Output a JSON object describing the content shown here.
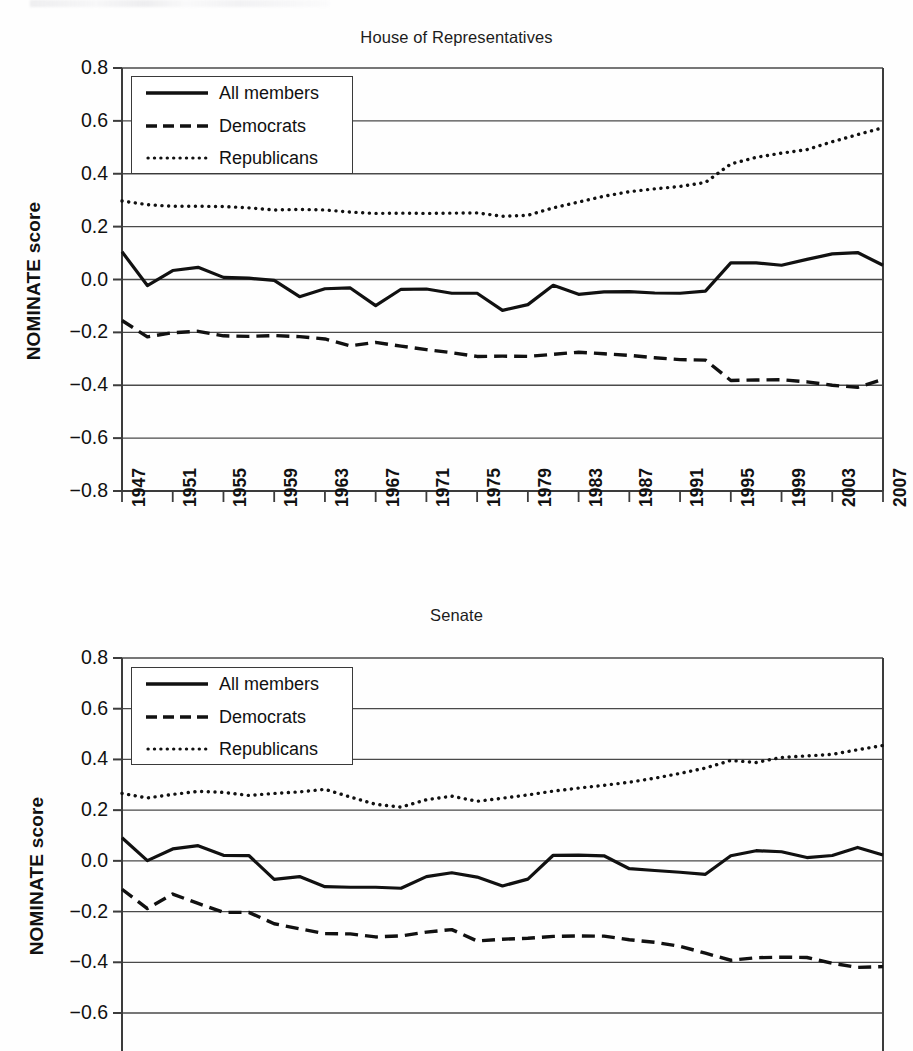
{
  "charts": {
    "house": {
      "title": "House of Representatives",
      "ylabel": "NOMINATE score",
      "legend": {
        "all": "All members",
        "dem": "Democrats",
        "rep": "Republicans"
      }
    },
    "senate": {
      "title": "Senate",
      "ylabel": "NOMINATE score",
      "legend": {
        "all": "All members",
        "dem": "Democrats",
        "rep": "Republicans"
      }
    }
  },
  "chart_data": [
    {
      "type": "line",
      "title": "House of Representatives",
      "xlabel": "",
      "ylabel": "NOMINATE score",
      "ylim": [
        -0.8,
        0.8
      ],
      "yticks": [
        0.8,
        0.6,
        0.4,
        0.2,
        0.0,
        -0.2,
        -0.4,
        -0.6,
        -0.8
      ],
      "ytick_labels": [
        "0.8",
        "0.6",
        "0.4",
        "0.2",
        "0.0",
        "−0.2",
        "−0.4",
        "−0.6",
        "−0.8"
      ],
      "grid": true,
      "legend_position": "upper-left",
      "x": [
        1947,
        1949,
        1951,
        1953,
        1955,
        1957,
        1959,
        1961,
        1963,
        1965,
        1967,
        1969,
        1971,
        1973,
        1975,
        1977,
        1979,
        1981,
        1983,
        1985,
        1987,
        1989,
        1991,
        1993,
        1995,
        1997,
        1999,
        2001,
        2003,
        2005,
        2007
      ],
      "xtick_labels": [
        "1947",
        "1951",
        "1955",
        "1959",
        "1963",
        "1967",
        "1971",
        "1975",
        "1979",
        "1983",
        "1987",
        "1991",
        "1995",
        "1999",
        "2003",
        "2007"
      ],
      "series": [
        {
          "name": "All members",
          "style": "solid",
          "values": [
            0.105,
            -0.023,
            0.034,
            0.046,
            0.008,
            0.005,
            -0.003,
            -0.065,
            -0.035,
            -0.032,
            -0.099,
            -0.037,
            -0.036,
            -0.052,
            -0.052,
            -0.117,
            -0.095,
            -0.022,
            -0.056,
            -0.047,
            -0.046,
            -0.051,
            -0.052,
            -0.044,
            0.063,
            0.063,
            0.054,
            0.076,
            0.097,
            0.102,
            0.054
          ]
        },
        {
          "name": "Democrats",
          "style": "dashed",
          "values": [
            -0.155,
            -0.217,
            -0.201,
            -0.196,
            -0.213,
            -0.215,
            -0.212,
            -0.216,
            -0.225,
            -0.251,
            -0.238,
            -0.252,
            -0.265,
            -0.277,
            -0.291,
            -0.29,
            -0.291,
            -0.283,
            -0.275,
            -0.281,
            -0.287,
            -0.296,
            -0.303,
            -0.305,
            -0.382,
            -0.38,
            -0.379,
            -0.387,
            -0.4,
            -0.408,
            -0.378
          ]
        },
        {
          "name": "Republicans",
          "style": "dotted",
          "values": [
            0.297,
            0.283,
            0.277,
            0.277,
            0.276,
            0.271,
            0.263,
            0.265,
            0.263,
            0.255,
            0.25,
            0.251,
            0.25,
            0.251,
            0.252,
            0.239,
            0.243,
            0.271,
            0.293,
            0.315,
            0.332,
            0.343,
            0.352,
            0.367,
            0.437,
            0.462,
            0.478,
            0.491,
            0.521,
            0.548,
            0.574
          ]
        }
      ]
    },
    {
      "type": "line",
      "title": "Senate",
      "xlabel": "",
      "ylabel": "NOMINATE score",
      "ylim": [
        -0.7,
        0.8
      ],
      "yticks": [
        0.8,
        0.6,
        0.4,
        0.2,
        0.0,
        -0.2,
        -0.4,
        -0.6
      ],
      "ytick_labels": [
        "0.8",
        "0.6",
        "0.4",
        "0.2",
        "0.0",
        "−0.2",
        "−0.4",
        "−0.6"
      ],
      "grid": true,
      "legend_position": "upper-left",
      "note": "bottom of plot is cropped by the image edge",
      "x": [
        1947,
        1949,
        1951,
        1953,
        1955,
        1957,
        1959,
        1961,
        1963,
        1965,
        1967,
        1969,
        1971,
        1973,
        1975,
        1977,
        1979,
        1981,
        1983,
        1985,
        1987,
        1989,
        1991,
        1993,
        1995,
        1997,
        1999,
        2001,
        2003,
        2005,
        2007
      ],
      "series": [
        {
          "name": "All members",
          "style": "solid",
          "values": [
            0.091,
            0.001,
            0.047,
            0.06,
            0.022,
            0.021,
            -0.073,
            -0.062,
            -0.102,
            -0.104,
            -0.104,
            -0.108,
            -0.062,
            -0.047,
            -0.064,
            -0.099,
            -0.072,
            0.022,
            0.023,
            0.02,
            -0.031,
            -0.038,
            -0.045,
            -0.053,
            0.02,
            0.04,
            0.036,
            0.013,
            0.021,
            0.053,
            0.023
          ]
        },
        {
          "name": "Democrats",
          "style": "dashed",
          "values": [
            -0.112,
            -0.188,
            -0.131,
            -0.168,
            -0.203,
            -0.203,
            -0.248,
            -0.268,
            -0.287,
            -0.288,
            -0.3,
            -0.296,
            -0.281,
            -0.271,
            -0.316,
            -0.309,
            -0.305,
            -0.298,
            -0.296,
            -0.297,
            -0.311,
            -0.321,
            -0.337,
            -0.364,
            -0.392,
            -0.382,
            -0.38,
            -0.381,
            -0.404,
            -0.42,
            -0.417
          ]
        },
        {
          "name": "Republicans",
          "style": "dotted",
          "values": [
            0.266,
            0.248,
            0.262,
            0.274,
            0.27,
            0.258,
            0.266,
            0.272,
            0.282,
            0.252,
            0.223,
            0.212,
            0.241,
            0.255,
            0.235,
            0.247,
            0.26,
            0.275,
            0.287,
            0.298,
            0.31,
            0.326,
            0.345,
            0.366,
            0.396,
            0.388,
            0.408,
            0.414,
            0.42,
            0.438,
            0.455
          ]
        }
      ]
    }
  ]
}
